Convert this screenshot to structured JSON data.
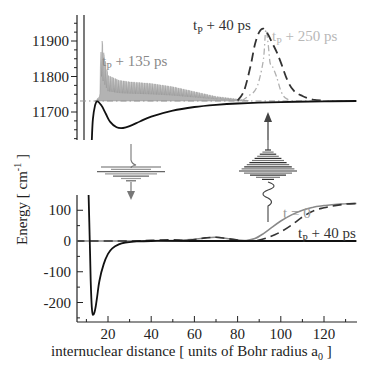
{
  "chart_data": [
    {
      "type": "line",
      "panel": "upper",
      "title": "",
      "xlabel": "",
      "ylabel": "",
      "ylim": [
        11615,
        11970
      ],
      "xlim": [
        5,
        135
      ],
      "y_ticks": [
        11700,
        11800,
        11900
      ],
      "y_tick_labels": [
        "11700",
        "11800",
        "11900"
      ],
      "grid": false,
      "series": [
        {
          "name": "excited-state potential",
          "style": "solid",
          "color": "#111111",
          "x": [
            12.5,
            13,
            14,
            15,
            17,
            19,
            21,
            24,
            27,
            30,
            35,
            40,
            50,
            60,
            70,
            80,
            100,
            120,
            135
          ],
          "y": [
            11620,
            11680,
            11718,
            11730,
            11718,
            11695,
            11672,
            11657,
            11655,
            11660,
            11674,
            11687,
            11704,
            11714,
            11720,
            11724,
            11728,
            11730,
            11731
          ]
        },
        {
          "name": "tp + 135 ps",
          "style": "solid-oscillating",
          "color": "#888888",
          "envelope_x": [
            14,
            16,
            17,
            18,
            20,
            25,
            30,
            40,
            50,
            60,
            70,
            80,
            85
          ],
          "envelope_y": [
            11730,
            11745,
            11928,
            11880,
            11810,
            11795,
            11790,
            11785,
            11775,
            11760,
            11745,
            11737,
            11732
          ]
        },
        {
          "name": "tp + 40 ps",
          "style": "dashed",
          "color": "#333333",
          "x": [
            80,
            83,
            86,
            88,
            90,
            92,
            94,
            96,
            98,
            100,
            103,
            106,
            110,
            115,
            120
          ],
          "y": [
            11732,
            11760,
            11830,
            11890,
            11925,
            11935,
            11920,
            11895,
            11870,
            11840,
            11790,
            11760,
            11745,
            11735,
            11732
          ]
        },
        {
          "name": "tp + 250 ps",
          "style": "dash-dot",
          "color": "#b0b0b0",
          "x": [
            82,
            85,
            88,
            90,
            92,
            93,
            94,
            95,
            96,
            98,
            100,
            102,
            105
          ],
          "y": [
            11732,
            11745,
            11760,
            11790,
            11850,
            11930,
            11900,
            11840,
            11830,
            11800,
            11760,
            11740,
            11732
          ]
        }
      ],
      "annotations": [
        {
          "text": "t",
          "sub": "P",
          "rest": " + 135 ps",
          "color": "#888888",
          "near_series": "tp + 135 ps"
        },
        {
          "text": "t",
          "sub": "P",
          "rest": " + 40 ps",
          "color": "#333333",
          "near_series": "tp + 40 ps"
        },
        {
          "text": "t",
          "sub": "P",
          "rest": " + 250 ps",
          "color": "#b8b8b8",
          "near_series": "tp + 250 ps"
        }
      ]
    },
    {
      "type": "line",
      "panel": "lower",
      "title": "",
      "xlabel": "internuclear distance [ units of Bohr radius a0 ]",
      "ylabel": "Energy [ cm-1 ]",
      "xlim": [
        5,
        135
      ],
      "ylim": [
        -262,
        150
      ],
      "x_ticks": [
        20,
        40,
        60,
        80,
        100,
        120
      ],
      "x_tick_labels": [
        "20",
        "40",
        "60",
        "80",
        "100",
        "120"
      ],
      "y_ticks": [
        -200,
        -100,
        0,
        100
      ],
      "y_tick_labels": [
        "-200",
        "-100",
        "0",
        "100"
      ],
      "grid": false,
      "series": [
        {
          "name": "ground-state potential",
          "style": "solid",
          "color": "#111111",
          "x": [
            11,
            11.5,
            12,
            12.5,
            13,
            14,
            15,
            16,
            18,
            20,
            22,
            25,
            28,
            32,
            40,
            60,
            135
          ],
          "y": [
            150,
            20,
            -130,
            -215,
            -240,
            -225,
            -180,
            -130,
            -75,
            -42,
            -24,
            -11,
            -5,
            -2,
            0,
            0,
            0
          ]
        },
        {
          "name": "t = 0",
          "style": "solid",
          "color": "#888888",
          "x": [
            5,
            30,
            40,
            50,
            55,
            60,
            65,
            70,
            75,
            80,
            84,
            88,
            92,
            96,
            100,
            105,
            110,
            115,
            120,
            125,
            130,
            135
          ],
          "y": [
            0,
            0,
            1,
            2,
            3,
            6,
            10,
            12,
            8,
            3,
            2,
            8,
            24,
            45,
            65,
            85,
            100,
            110,
            115,
            119,
            121,
            122
          ]
        },
        {
          "name": "tp + 40 ps",
          "style": "dashed",
          "color": "#333333",
          "x": [
            5,
            30,
            40,
            50,
            55,
            60,
            65,
            70,
            75,
            80,
            85,
            90,
            95,
            100,
            105,
            110,
            115,
            120,
            125,
            130,
            135
          ],
          "y": [
            0,
            0,
            2,
            4,
            2,
            5,
            10,
            12,
            8,
            3,
            0,
            3,
            14,
            30,
            52,
            78,
            98,
            108,
            115,
            120,
            122
          ]
        }
      ],
      "annotations": [
        {
          "text": "t = 0",
          "color": "#999999",
          "near_series": "t = 0"
        },
        {
          "text": "t",
          "sub": "P",
          "rest": " + 40 ps",
          "color": "#333333",
          "near_series": "tp + 40 ps"
        }
      ]
    }
  ],
  "insets": [
    {
      "name": "small-wavepacket",
      "description": "laser pulse excitation schematic with downward arrow",
      "color": "#777777"
    },
    {
      "name": "large-wavepacket",
      "description": "laser pulse schematic with upward arrow",
      "color": "#444444"
    }
  ],
  "labels": {
    "ylabel_main": "Energy [ cm",
    "ylabel_sup": "-1",
    "ylabel_end": " ]",
    "xlabel_main": "internuclear distance [ units of Bohr radius a",
    "xlabel_sub": "0",
    "xlabel_end": " ]"
  }
}
